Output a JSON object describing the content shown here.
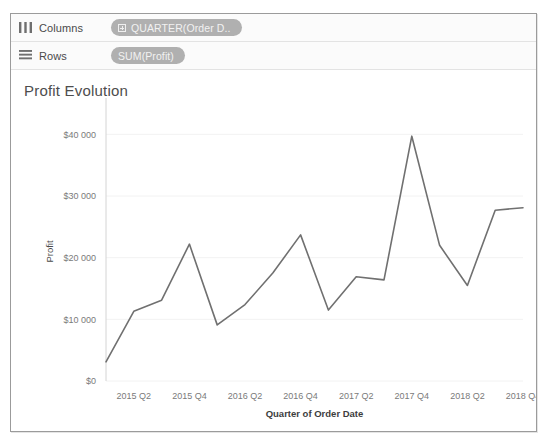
{
  "window": {
    "background_color": "#ffffff",
    "frame_border_color": "#9b9b9b"
  },
  "shelves": [
    {
      "name": "columns-shelf",
      "label": "Columns",
      "icon": "columns-icon",
      "pill": {
        "label": "QUARTER(Order D..",
        "icon": "plus-box-icon",
        "type": "dimension",
        "color": "#b0b0b0"
      }
    },
    {
      "name": "rows-shelf",
      "label": "Rows",
      "icon": "rows-icon",
      "pill": {
        "label": "SUM(Profit)",
        "icon": "",
        "type": "measure",
        "color": "#b0b0b0"
      }
    }
  ],
  "chart_data": {
    "type": "line",
    "title": "Profit Evolution",
    "xlabel": "Quarter of Order Date",
    "ylabel": "Profit",
    "grid": true,
    "legend": "none",
    "line_color": "#707070",
    "ylim": [
      0,
      42000
    ],
    "ytick_labels": [
      "$0",
      "$10 000",
      "$20 000",
      "$30 000",
      "$40 000"
    ],
    "ytick_values": [
      0,
      10000,
      20000,
      30000,
      40000
    ],
    "xtick_labels": [
      "2015 Q2",
      "2015 Q4",
      "2016 Q2",
      "2016 Q4",
      "2017 Q2",
      "2017 Q4",
      "2018 Q2",
      "2018 Q4"
    ],
    "categories": [
      "2015 Q1",
      "2015 Q2",
      "2015 Q3",
      "2015 Q4",
      "2016 Q1",
      "2016 Q2",
      "2016 Q3",
      "2016 Q4",
      "2017 Q1",
      "2017 Q2",
      "2017 Q3",
      "2017 Q4",
      "2018 Q1",
      "2018 Q2",
      "2018 Q3",
      "2018 Q4"
    ],
    "values": [
      3100,
      11300,
      13100,
      22200,
      9100,
      12400,
      17500,
      23700,
      11500,
      16900,
      16400,
      39700,
      22000,
      15500,
      27700,
      28100
    ]
  }
}
